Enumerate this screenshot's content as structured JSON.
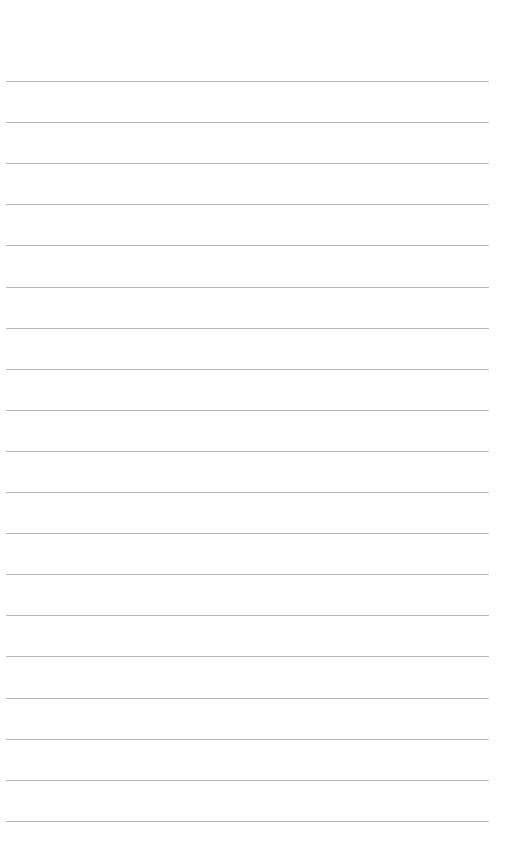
{
  "page": {
    "type": "lined-paper",
    "background": "#ffffff",
    "line_color": "#b9b9b9",
    "line_count": 19,
    "first_line_y": 81,
    "line_spacing": 41.1,
    "line_left": 6,
    "line_width": 483
  }
}
